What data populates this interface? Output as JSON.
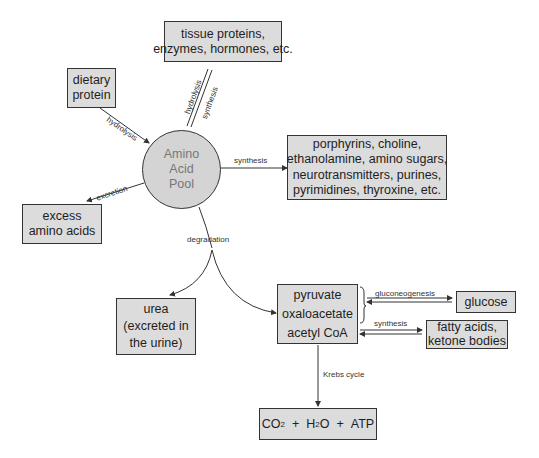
{
  "diagram": {
    "center": {
      "lines": [
        "Amino",
        "Acid",
        "Pool"
      ]
    },
    "nodes": {
      "tissue": {
        "lines": [
          "tissue proteins,",
          "enzymes, hormones, etc."
        ]
      },
      "dietary": {
        "lines": [
          "dietary",
          "protein"
        ]
      },
      "porphyrins": {
        "lines": [
          "porphyrins, choline,",
          "ethanolamine, amino sugars,",
          "neurotransmitters, purines,",
          "pyrimidines, thyroxine, etc."
        ]
      },
      "excess": {
        "lines": [
          "excess",
          "amino acids"
        ]
      },
      "urea": {
        "lines": [
          "urea",
          "(excreted in",
          "the urine)"
        ]
      },
      "intermediates": {
        "lines": [
          "pyruvate",
          "oxaloacetate",
          "acetyl CoA"
        ]
      },
      "glucose": {
        "lines": [
          "glucose"
        ]
      },
      "fatty": {
        "lines": [
          "fatty acids,",
          "ketone bodies"
        ]
      },
      "products": {
        "co2": "CO",
        "co2_sub": "2",
        "plus1": "+",
        "h2o_h": "H",
        "h2o_sub": "2",
        "h2o_o": "O",
        "plus2": "+",
        "atp": "ATP"
      }
    },
    "edges": {
      "dietary_to_pool": "hydrolysis",
      "tissue_hydrolysis": "hydrolysis",
      "tissue_synthesis": "synthesis",
      "pool_to_porphyrins": "synthesis",
      "pool_to_excess": "excretion",
      "pool_degradation": "degradation",
      "to_glucose": "gluconeogenesis",
      "to_fatty": "synthesis",
      "krebs": "Krebs cycle"
    }
  }
}
